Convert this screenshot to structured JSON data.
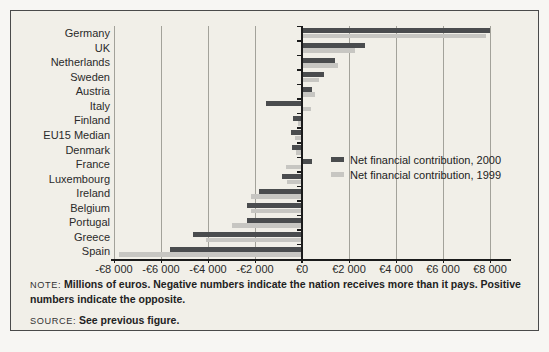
{
  "chart_data": {
    "type": "bar",
    "orientation": "horizontal",
    "categories": [
      "Germany",
      "UK",
      "Netherlands",
      "Sweden",
      "Austria",
      "Italy",
      "Finland",
      "EU15 Median",
      "Denmark",
      "France",
      "Luxembourg",
      "Ireland",
      "Belgium",
      "Portugal",
      "Greece",
      "Spain"
    ],
    "series": [
      {
        "name": "Net financial contribution, 2000",
        "color": "#4a4c4e",
        "values": [
          7950,
          2650,
          1350,
          900,
          400,
          -1550,
          -400,
          -450,
          -420,
          400,
          -850,
          -1850,
          -2350,
          -2350,
          -4650,
          -5600
        ]
      },
      {
        "name": "Net financial contribution, 1999",
        "color": "#c7c6c2",
        "values": [
          7800,
          2200,
          1500,
          700,
          500,
          350,
          -150,
          -300,
          -250,
          -700,
          -650,
          -2150,
          -2150,
          -3000,
          -4100,
          -7800
        ]
      }
    ],
    "x_axis": {
      "min": -8000,
      "max": 8000,
      "step": 2000,
      "tick_labels": [
        "-€8 000",
        "-€6 000",
        "-€4 000",
        "-€2 000",
        "€0",
        "€2 000",
        "€4 000",
        "€6 000",
        "€8 000"
      ]
    },
    "legend_position": "middle-right",
    "gridlines": true,
    "title": "",
    "units": "Millions of euros"
  },
  "figure": {
    "note_label": "NOTE:",
    "note_text": "Millions of euros. Negative numbers indicate the nation receives more than it pays. Positive numbers indicate the opposite.",
    "source_label": "SOURCE:",
    "source_text": "See previous figure."
  }
}
